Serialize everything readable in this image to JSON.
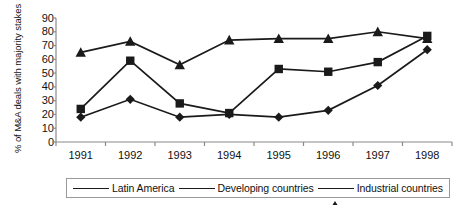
{
  "chart_data": {
    "type": "line",
    "title": "",
    "xlabel": "",
    "ylabel": "% of M&A deals with majority stakes",
    "categories": [
      "1991",
      "1992",
      "1993",
      "1994",
      "1995",
      "1996",
      "1997",
      "1998"
    ],
    "x": [
      1991,
      1992,
      1993,
      1994,
      1995,
      1996,
      1997,
      1998
    ],
    "ylim": [
      0,
      90
    ],
    "yticks": [
      0,
      10,
      20,
      30,
      40,
      50,
      60,
      70,
      80,
      90
    ],
    "ytick_labels": [
      "0",
      "10",
      "20",
      "30",
      "40",
      "50",
      "60",
      "70",
      "80",
      "90"
    ],
    "grid": false,
    "legend_position": "bottom",
    "series": [
      {
        "name": "Latin America",
        "marker": "square",
        "color": "#1a1a1a",
        "values": [
          24,
          59,
          28,
          21,
          53,
          51,
          58,
          77
        ]
      },
      {
        "name": "Developing countries",
        "marker": "diamond",
        "color": "#1a1a1a",
        "values": [
          18,
          31,
          18,
          20,
          18,
          23,
          41,
          67
        ]
      },
      {
        "name": "Industrial countries",
        "marker": "triangle",
        "color": "#1a1a1a",
        "values": [
          65,
          73,
          56,
          74,
          75,
          75,
          80,
          75
        ]
      }
    ]
  },
  "legend": {
    "items": [
      {
        "label": "Latin America",
        "marker": "square"
      },
      {
        "label": "Developing countries",
        "marker": "diamond"
      },
      {
        "label": "Industrial countries",
        "marker": "triangle"
      }
    ]
  },
  "axes": {
    "y_title": "% of M&A deals with majority stakes",
    "y_tick_labels": [
      "90",
      "80",
      "70",
      "60",
      "50",
      "40",
      "30",
      "20",
      "10",
      "0"
    ],
    "x_tick_labels": [
      "1991",
      "1992",
      "1993",
      "1994",
      "1995",
      "1996",
      "1997",
      "1998"
    ]
  },
  "colors": {
    "ink": "#1a1a1a",
    "axis": "#8a8a8a",
    "background": "#ffffff"
  }
}
